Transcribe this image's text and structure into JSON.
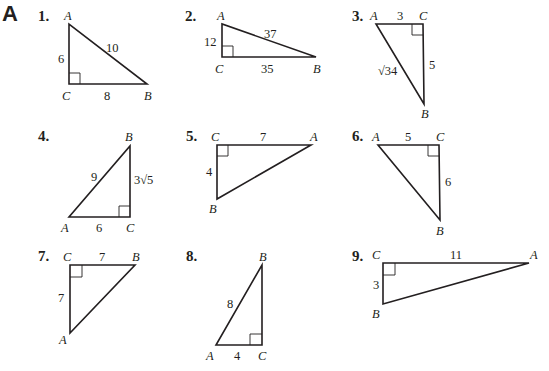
{
  "section_label": "A",
  "problems": [
    {
      "number": "1.",
      "vertices": {
        "A": "A",
        "B": "B",
        "C": "C"
      },
      "sides": {
        "AC": "6",
        "AB": "10",
        "CB": "8"
      }
    },
    {
      "number": "2.",
      "vertices": {
        "A": "A",
        "B": "B",
        "C": "C"
      },
      "sides": {
        "AC": "12",
        "AB": "37",
        "CB": "35"
      }
    },
    {
      "number": "3.",
      "vertices": {
        "A": "A",
        "B": "B",
        "C": "C"
      },
      "sides": {
        "AC": "3",
        "AB": "√34",
        "CB": "5"
      }
    },
    {
      "number": "4.",
      "vertices": {
        "A": "A",
        "B": "B",
        "C": "C"
      },
      "sides": {
        "AB": "9",
        "BC": "3√5",
        "AC": "6"
      }
    },
    {
      "number": "5.",
      "vertices": {
        "A": "A",
        "B": "B",
        "C": "C"
      },
      "sides": {
        "CA": "7",
        "CB": "4"
      }
    },
    {
      "number": "6.",
      "vertices": {
        "A": "A",
        "B": "B",
        "C": "C"
      },
      "sides": {
        "AC": "5",
        "CB": "6"
      }
    },
    {
      "number": "7.",
      "vertices": {
        "A": "A",
        "B": "B",
        "C": "C"
      },
      "sides": {
        "CB": "7",
        "CA": "7"
      }
    },
    {
      "number": "8.",
      "vertices": {
        "A": "A",
        "B": "B",
        "C": "C"
      },
      "sides": {
        "AB": "8",
        "AC": "4"
      }
    },
    {
      "number": "9.",
      "vertices": {
        "A": "A",
        "B": "B",
        "C": "C"
      },
      "sides": {
        "CA": "11",
        "CB": "3"
      }
    }
  ]
}
